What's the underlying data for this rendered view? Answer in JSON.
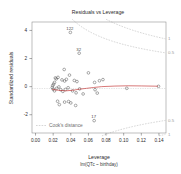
{
  "chart_data": {
    "type": "scatter",
    "title": "Residuals vs Leverage",
    "xlabel": "Leverage",
    "sublabel": "lm(QTc ~ birthday)",
    "ylabel": "Standardized residuals",
    "xlim": [
      -0.004,
      0.148
    ],
    "ylim": [
      -3.3,
      4.6
    ],
    "xticks": [
      "0.00",
      "0.02",
      "0.04",
      "0.06",
      "0.08",
      "0.10",
      "0.12",
      "0.14"
    ],
    "xtickvals": [
      0.0,
      0.02,
      0.04,
      0.06,
      0.08,
      0.1,
      0.12,
      0.14
    ],
    "yticks": [
      "4",
      "2",
      "0",
      "-2"
    ],
    "ytickvals": [
      4,
      2,
      0,
      -2
    ],
    "grid": false,
    "legend_position": "bottom-left",
    "legend_label": "Cook's distance",
    "zero_line": true,
    "points": [
      {
        "x": 0.0395,
        "y": 3.86,
        "label": "122"
      },
      {
        "x": 0.0495,
        "y": 2.38,
        "label": "32"
      },
      {
        "x": 0.0325,
        "y": 1.22,
        "label": ""
      },
      {
        "x": 0.0385,
        "y": 0.82,
        "label": ""
      },
      {
        "x": 0.06,
        "y": 0.98,
        "label": ""
      },
      {
        "x": 0.0225,
        "y": 0.62,
        "label": ""
      },
      {
        "x": 0.0235,
        "y": 0.55,
        "label": ""
      },
      {
        "x": 0.0255,
        "y": 0.66,
        "label": ""
      },
      {
        "x": 0.03,
        "y": 0.48,
        "label": ""
      },
      {
        "x": 0.033,
        "y": 0.4,
        "label": ""
      },
      {
        "x": 0.035,
        "y": 0.52,
        "label": ""
      },
      {
        "x": 0.044,
        "y": 0.44,
        "label": ""
      },
      {
        "x": 0.047,
        "y": 0.36,
        "label": ""
      },
      {
        "x": 0.0215,
        "y": 0.3,
        "label": ""
      },
      {
        "x": 0.0205,
        "y": 0.18,
        "label": ""
      },
      {
        "x": 0.0195,
        "y": 0.08,
        "label": ""
      },
      {
        "x": 0.019,
        "y": -0.06,
        "label": ""
      },
      {
        "x": 0.02,
        "y": -0.18,
        "label": ""
      },
      {
        "x": 0.0215,
        "y": -0.3,
        "label": ""
      },
      {
        "x": 0.024,
        "y": -0.12,
        "label": ""
      },
      {
        "x": 0.0265,
        "y": -0.02,
        "label": ""
      },
      {
        "x": 0.0285,
        "y": -0.22,
        "label": ""
      },
      {
        "x": 0.031,
        "y": -0.34,
        "label": ""
      },
      {
        "x": 0.034,
        "y": -0.2,
        "label": ""
      },
      {
        "x": 0.037,
        "y": -0.08,
        "label": ""
      },
      {
        "x": 0.042,
        "y": -0.3,
        "label": ""
      },
      {
        "x": 0.046,
        "y": -0.44,
        "label": ""
      },
      {
        "x": 0.05,
        "y": -0.16,
        "label": ""
      },
      {
        "x": 0.054,
        "y": -0.52,
        "label": ""
      },
      {
        "x": 0.025,
        "y": -1.04,
        "label": ""
      },
      {
        "x": 0.027,
        "y": -1.28,
        "label": ""
      },
      {
        "x": 0.033,
        "y": -1.1,
        "label": ""
      },
      {
        "x": 0.0375,
        "y": -1.06,
        "label": ""
      },
      {
        "x": 0.04,
        "y": -1.16,
        "label": ""
      },
      {
        "x": 0.0455,
        "y": -1.34,
        "label": ""
      },
      {
        "x": 0.0675,
        "y": -0.22,
        "label": ""
      },
      {
        "x": 0.07,
        "y": -0.46,
        "label": ""
      },
      {
        "x": 0.0725,
        "y": 0.42,
        "label": ""
      },
      {
        "x": 0.0765,
        "y": 0.5,
        "label": ""
      },
      {
        "x": 0.067,
        "y": 0.3,
        "label": ""
      },
      {
        "x": 0.0665,
        "y": -2.42,
        "label": "17"
      },
      {
        "x": 0.1035,
        "y": -0.12,
        "label": ""
      },
      {
        "x": 0.1395,
        "y": 0.02,
        "label": ""
      }
    ],
    "smooth_line": [
      {
        "x": 0.019,
        "y": -0.2
      },
      {
        "x": 0.026,
        "y": -0.26
      },
      {
        "x": 0.034,
        "y": -0.3
      },
      {
        "x": 0.042,
        "y": -0.26
      },
      {
        "x": 0.05,
        "y": -0.18
      },
      {
        "x": 0.058,
        "y": -0.12
      },
      {
        "x": 0.066,
        "y": -0.06
      },
      {
        "x": 0.075,
        "y": 0.0
      },
      {
        "x": 0.09,
        "y": 0.04
      },
      {
        "x": 0.105,
        "y": 0.06
      },
      {
        "x": 0.12,
        "y": 0.05
      },
      {
        "x": 0.139,
        "y": 0.03
      }
    ],
    "cook_contours": [
      {
        "level": "1",
        "label": "1"
      },
      {
        "level": "0.5",
        "label": "0.5"
      }
    ],
    "cook_contour_labels": [
      "1",
      "0.5",
      "0.5",
      "1"
    ]
  }
}
